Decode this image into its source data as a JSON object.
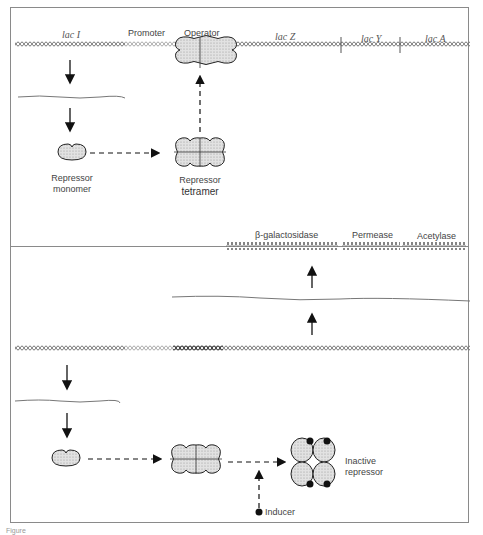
{
  "figure": {
    "top_panel": {
      "title": "Repressed state",
      "gene_labels": [
        "lac I",
        "Promoter",
        "Operator",
        "lac Z",
        "lac Y",
        "lac A"
      ],
      "repressor_monomer_label": [
        "Repressor",
        "monomer"
      ],
      "repressor_tetramer_label": [
        "Repressor",
        "tetramer"
      ]
    },
    "bottom_panel": {
      "title": "Induced state",
      "protein_labels": [
        "β-galactosidase",
        "Permease",
        "Acetylase"
      ],
      "inactive_repressor_label": [
        "Inactive",
        "repressor"
      ],
      "inducer_label": "Inducer"
    },
    "caption": "Figure"
  },
  "colors": {
    "dna": "#777777",
    "dna_dark": "#333333",
    "arrow": "#111111",
    "protein_fill": "#d8d8d8",
    "frame": "#8a8a8a"
  }
}
